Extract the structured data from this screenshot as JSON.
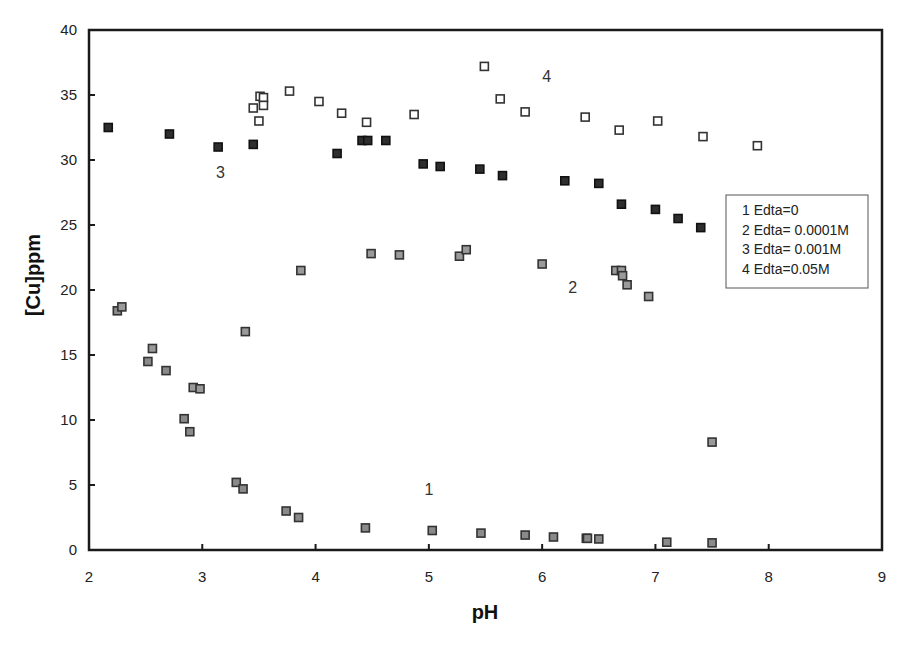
{
  "chart_data": {
    "type": "scatter",
    "title": "",
    "xlabel": "pH",
    "ylabel": "[Cu]ppm",
    "xlim": [
      2,
      9
    ],
    "ylim": [
      0,
      40
    ],
    "xticks": [
      2,
      3,
      4,
      5,
      6,
      7,
      8,
      9
    ],
    "yticks": [
      0,
      5,
      10,
      15,
      20,
      25,
      30,
      35,
      40
    ],
    "grid": false,
    "legend_position": "right-middle inside",
    "legend": [
      "1 Edta=0",
      "2 Edta= 0.0001M",
      "3 Edta= 0.001M",
      "4 Edta=0.05M"
    ],
    "series": [
      {
        "name": "1 Edta=0",
        "label": "1",
        "label_pos": [
          5.0,
          4.2
        ],
        "marker": "gray-square",
        "fill": "#8a8a8a",
        "stroke": "#333333",
        "points": [
          [
            2.25,
            18.4
          ],
          [
            2.52,
            14.5
          ],
          [
            2.68,
            13.8
          ],
          [
            2.84,
            10.1
          ],
          [
            2.89,
            9.1
          ],
          [
            3.3,
            5.2
          ],
          [
            3.36,
            4.7
          ],
          [
            3.74,
            3.0
          ],
          [
            3.85,
            2.5
          ],
          [
            4.44,
            1.7
          ],
          [
            5.03,
            1.5
          ],
          [
            5.46,
            1.3
          ],
          [
            5.85,
            1.15
          ],
          [
            6.1,
            1.0
          ],
          [
            6.39,
            0.9
          ],
          [
            6.4,
            0.9
          ],
          [
            6.5,
            0.85
          ],
          [
            7.1,
            0.6
          ],
          [
            7.5,
            0.55
          ]
        ]
      },
      {
        "name": "2 Edta= 0.0001M",
        "label": "2",
        "label_pos": [
          6.27,
          19.8
        ],
        "marker": "gray-square",
        "fill": "#9a9a9a",
        "stroke": "#333333",
        "points": [
          [
            2.29,
            18.7
          ],
          [
            2.56,
            15.5
          ],
          [
            2.92,
            12.5
          ],
          [
            2.98,
            12.4
          ],
          [
            3.38,
            16.8
          ],
          [
            3.87,
            21.5
          ],
          [
            4.49,
            22.8
          ],
          [
            4.74,
            22.7
          ],
          [
            5.27,
            22.6
          ],
          [
            5.33,
            23.1
          ],
          [
            6.0,
            22.0
          ],
          [
            6.65,
            21.5
          ],
          [
            6.7,
            21.5
          ],
          [
            6.71,
            21.1
          ],
          [
            6.75,
            20.4
          ],
          [
            6.94,
            19.5
          ],
          [
            7.5,
            8.3
          ]
        ]
      },
      {
        "name": "3 Edta= 0.001M",
        "label": "3",
        "label_pos": [
          3.16,
          28.6
        ],
        "marker": "filled-square",
        "fill": "#2e2e2e",
        "stroke": "#111111",
        "points": [
          [
            2.17,
            32.5
          ],
          [
            2.71,
            32.0
          ],
          [
            3.14,
            31.0
          ],
          [
            3.45,
            31.2
          ],
          [
            4.19,
            30.5
          ],
          [
            4.41,
            31.5
          ],
          [
            4.46,
            31.5
          ],
          [
            4.62,
            31.5
          ],
          [
            4.95,
            29.7
          ],
          [
            5.1,
            29.5
          ],
          [
            5.45,
            29.3
          ],
          [
            5.65,
            28.8
          ],
          [
            6.2,
            28.4
          ],
          [
            6.5,
            28.2
          ],
          [
            6.7,
            26.6
          ],
          [
            7.0,
            26.2
          ],
          [
            7.2,
            25.5
          ],
          [
            7.4,
            24.8
          ]
        ]
      },
      {
        "name": "4 Edta=0.05M",
        "label": "4",
        "label_pos": [
          6.04,
          36.0
        ],
        "marker": "open-square",
        "fill": "#ffffff",
        "stroke": "#333333",
        "points": [
          [
            3.45,
            34.0
          ],
          [
            3.5,
            33.0
          ],
          [
            3.51,
            34.9
          ],
          [
            3.54,
            34.8
          ],
          [
            3.54,
            34.2
          ],
          [
            3.77,
            35.3
          ],
          [
            4.03,
            34.5
          ],
          [
            4.23,
            33.6
          ],
          [
            4.45,
            32.9
          ],
          [
            4.87,
            33.5
          ],
          [
            5.49,
            37.2
          ],
          [
            5.63,
            34.7
          ],
          [
            5.85,
            33.7
          ],
          [
            6.38,
            33.3
          ],
          [
            6.68,
            32.3
          ],
          [
            7.02,
            33.0
          ],
          [
            7.42,
            31.8
          ],
          [
            7.9,
            31.1
          ]
        ]
      }
    ]
  },
  "layout": {
    "plot": {
      "left": 89,
      "top": 30,
      "right": 882,
      "bottom": 550
    },
    "legend_box": {
      "x": 726,
      "y": 195,
      "w": 142,
      "h": 93
    }
  }
}
